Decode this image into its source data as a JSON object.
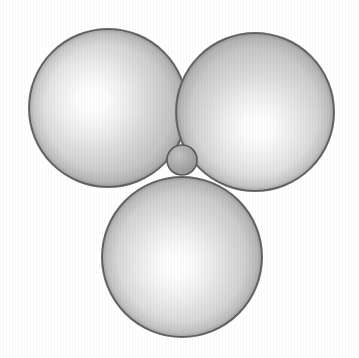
{
  "figure": {
    "title": "Three tangent large spheres with a small interstitial sphere",
    "caption": "",
    "width": 359,
    "height": 358,
    "background_color": "#ffffff",
    "view_label": "top view",
    "arrangement": "trigonal planar close packing",
    "colors": {
      "sphere_highlight": "#ffffff",
      "sphere_midtone": "#c9c9c9",
      "sphere_shadow": "#a8a8a8",
      "sphere_outline": "#6e6e6e",
      "small_sphere_midtone": "#a9a9a9",
      "small_sphere_shadow": "#8a8a8a",
      "small_sphere_outline": "#595959",
      "background": "#ffffff"
    },
    "spheres": [
      {
        "id": "sphere-top-left",
        "label": "large sphere top-left",
        "cx": 108,
        "cy": 108,
        "r": 79,
        "size_class": "large",
        "highlight_cx": 100,
        "highlight_cy": 112,
        "outline_color": "#6e6e6e",
        "outline_width": 2.0
      },
      {
        "id": "sphere-top-right",
        "label": "large sphere top-right",
        "cx": 255,
        "cy": 112,
        "r": 79,
        "size_class": "large",
        "highlight_cx": 258,
        "highlight_cy": 128,
        "outline_color": "#6e6e6e",
        "outline_width": 2.0
      },
      {
        "id": "sphere-bottom",
        "label": "large sphere bottom-center",
        "cx": 182,
        "cy": 257,
        "r": 80,
        "size_class": "large",
        "highlight_cx": 176,
        "highlight_cy": 266,
        "outline_color": "#6e6e6e",
        "outline_width": 2.0
      },
      {
        "id": "sphere-interstitial",
        "label": "small interstitial sphere",
        "cx": 182,
        "cy": 160,
        "r": 15,
        "size_class": "small",
        "highlight_cx": 178,
        "highlight_cy": 154,
        "outline_color": "#595959",
        "outline_width": 1.6
      }
    ]
  }
}
